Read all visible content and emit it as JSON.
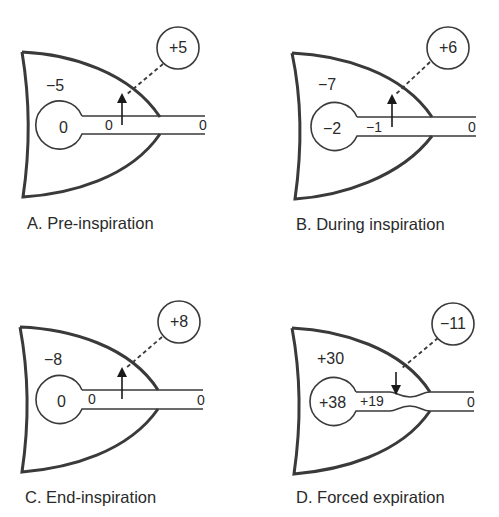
{
  "figure": {
    "panels": [
      {
        "id": "A",
        "caption": "A. Pre-inspiration",
        "pleural_pressure": "−5",
        "alveolar_pressure": "0",
        "airway_pressure": "0",
        "mouth_pressure": "0",
        "transmural_pressure": "+5",
        "arrow_direction": "up",
        "airway_compressed": false
      },
      {
        "id": "B",
        "caption": "B. During inspiration",
        "pleural_pressure": "−7",
        "alveolar_pressure": "−2",
        "airway_pressure": "−1",
        "mouth_pressure": "0",
        "transmural_pressure": "+6",
        "arrow_direction": "up",
        "airway_compressed": false
      },
      {
        "id": "C",
        "caption": "C. End-inspiration",
        "pleural_pressure": "−8",
        "alveolar_pressure": "0",
        "airway_pressure": "0",
        "mouth_pressure": "0",
        "transmural_pressure": "+8",
        "arrow_direction": "up",
        "airway_compressed": false
      },
      {
        "id": "D",
        "caption": "D. Forced expiration",
        "pleural_pressure": "+30",
        "alveolar_pressure": "+38",
        "airway_pressure": "+19",
        "mouth_pressure": "0",
        "transmural_pressure": "−11",
        "arrow_direction": "down",
        "airway_compressed": true
      }
    ]
  },
  "colors": {
    "stroke": "#3a3a3a",
    "text": "#2a2a2a",
    "background": "#ffffff"
  }
}
